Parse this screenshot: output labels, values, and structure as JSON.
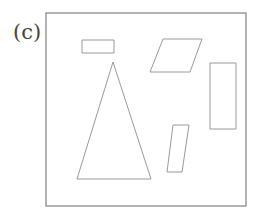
{
  "figure": {
    "label": "(c)",
    "colors": {
      "frame": "#8a8a8a",
      "shapes": "#9a9a9a",
      "text": "#444444"
    },
    "frame": {
      "x": 46,
      "y": 13,
      "width": 200,
      "height": 193
    },
    "shapes": [
      {
        "type": "rectangle",
        "name": "small-horizontal-rectangle",
        "points": "82,40 114,40 114,53 82,53"
      },
      {
        "type": "triangle",
        "name": "tall-triangle",
        "points": "113,62 151,179 77,179"
      },
      {
        "type": "parallelogram",
        "name": "wide-parallelogram",
        "points": "163,39 202,39 190,72 150,72"
      },
      {
        "type": "rectangle",
        "name": "tall-rectangle",
        "points": "210,63 236,63 236,129 210,129"
      },
      {
        "type": "parallelogram",
        "name": "slanted-parallelogram",
        "points": "173,125 189,125 182,172 167,172"
      }
    ]
  }
}
